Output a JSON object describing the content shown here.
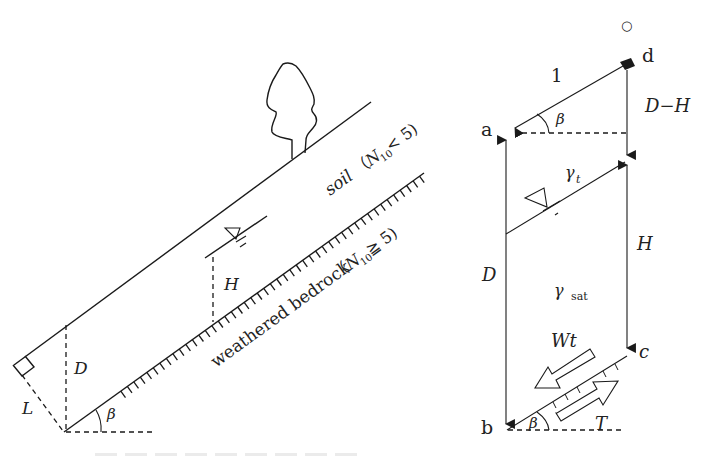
{
  "figure": {
    "left_panel": {
      "name": "infinite-slope-cross-section",
      "labels": {
        "soil": "soil",
        "soil_condition_open": "（",
        "soil_N": "N",
        "soil_N_sub": "10",
        "soil_condition_rest": " < 5)",
        "bedrock": "weathered bedrock",
        "bedrock_condition_open": "（",
        "bedrock_N": "N",
        "bedrock_N_sub": "10",
        "bedrock_condition_rest": " ≧ 5)",
        "depth": "D",
        "water_height": "H",
        "perpendicular_length": "L",
        "slope_angle": "β"
      },
      "icons": [
        "tree-icon",
        "water-table-icon",
        "right-angle-icon"
      ]
    },
    "right_panel": {
      "name": "slice-force-diagram",
      "labels": {
        "point_a": "a",
        "point_b": "b",
        "point_c": "c",
        "point_d": "d",
        "unit_length": "1",
        "slope_angle_top": "β",
        "slope_angle_bottom": "β",
        "upper_depth": "D−H",
        "water_height": "H",
        "total_depth": "D",
        "unit_weight_wet": "γ",
        "unit_weight_wet_sub": "t",
        "unit_weight_sat": "γ",
        "unit_weight_sat_sub": "sat",
        "weight_component": "Wt",
        "resisting_force": "T",
        "marker": "○"
      },
      "icons": [
        "water-table-icon",
        "weight-arrow-icon",
        "resistance-arrow-icon"
      ]
    },
    "caption": {
      "note": "caption text cropped at bottom edge, illegible"
    }
  }
}
